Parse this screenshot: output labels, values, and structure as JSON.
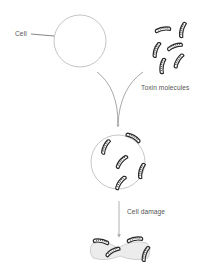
{
  "diagram": {
    "labels": {
      "cell": "Cell",
      "toxin_molecules": "Toxin molecules",
      "cell_damage": "Cell damage"
    },
    "stages": [
      {
        "name": "healthy-cell",
        "description": "Intact round cell"
      },
      {
        "name": "toxin-cluster",
        "description": "Group of six rod-shaped toxin molecules"
      },
      {
        "name": "cell-with-toxins",
        "description": "Cell with toxin molecules attached and inside"
      },
      {
        "name": "damaged-cell",
        "description": "Collapsed, deformed cell with toxins"
      }
    ],
    "colors": {
      "outline": "#b0b0b0",
      "toxin": "#333333",
      "arrow": "#a8a8a8",
      "text": "#555555"
    }
  }
}
